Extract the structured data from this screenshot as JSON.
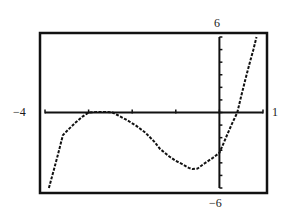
{
  "chart_data": {
    "type": "line",
    "title": "",
    "xlabel": "",
    "ylabel": "",
    "xlim": [
      -4,
      1
    ],
    "ylim": [
      -6,
      6
    ],
    "grid": false,
    "legend": null,
    "x_tick_step": 1,
    "y_tick_step": 1,
    "window_labels": {
      "xmin": "−4",
      "xmax": "1",
      "ymin": "−6",
      "ymax": "6"
    },
    "series": [
      {
        "name": "f(x)",
        "style": "dotted-pixel",
        "points": [
          [
            -3.91,
            -6.0
          ],
          [
            -3.8,
            -4.6
          ],
          [
            -3.7,
            -3.3
          ],
          [
            -3.59,
            -1.8
          ],
          [
            -3.45,
            -1.3
          ],
          [
            -3.3,
            -0.8
          ],
          [
            -3.15,
            -0.35
          ],
          [
            -3.0,
            0.0
          ],
          [
            -2.8,
            0.05
          ],
          [
            -2.6,
            0.05
          ],
          [
            -2.45,
            0.0
          ],
          [
            -2.34,
            -0.2
          ],
          [
            -2.15,
            -0.55
          ],
          [
            -1.93,
            -1.0
          ],
          [
            -1.7,
            -1.6
          ],
          [
            -1.5,
            -2.3
          ],
          [
            -1.36,
            -2.9
          ],
          [
            -1.15,
            -3.5
          ],
          [
            -1.0,
            -3.85
          ],
          [
            -0.85,
            -4.1
          ],
          [
            -0.7,
            -4.4
          ],
          [
            -0.62,
            -4.5
          ],
          [
            -0.5,
            -4.45
          ],
          [
            -0.32,
            -4.0
          ],
          [
            -0.15,
            -3.6
          ],
          [
            0.0,
            -3.2
          ],
          [
            0.1,
            -2.4
          ],
          [
            0.2,
            -1.6
          ],
          [
            0.3,
            -0.8
          ],
          [
            0.41,
            0.0
          ],
          [
            0.5,
            1.3
          ],
          [
            0.6,
            2.7
          ],
          [
            0.7,
            4.0
          ],
          [
            0.78,
            5.0
          ],
          [
            0.85,
            6.0
          ]
        ]
      }
    ]
  }
}
